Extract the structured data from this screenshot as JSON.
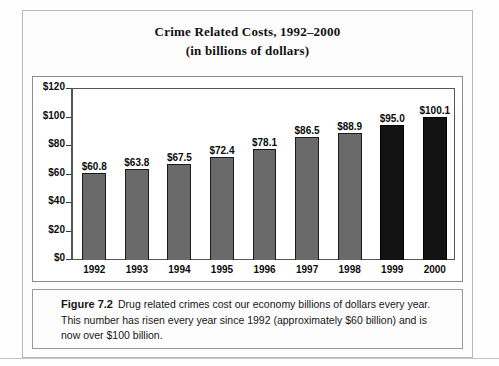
{
  "chart_title": "Crime Related Costs, 1992–2000",
  "chart_subtitle": "(in billions of dollars)",
  "caption": {
    "figure_number": "Figure 7.2",
    "body": "Drug related crimes cost our economy billions of dollars every year. This number has risen every year since 1992 (approximately $60 billion) and is now over $100 billion."
  },
  "colors": {
    "bar_gray": "#6a6a6a",
    "bar_black": "#121212",
    "frame": "#8d8d8d",
    "text": "#111111"
  },
  "chart_data": {
    "type": "bar",
    "title": "Crime Related Costs, 1992–2000",
    "subtitle": "(in billions of dollars)",
    "xlabel": "",
    "ylabel": "",
    "ylim": [
      0,
      120
    ],
    "ytick_values": [
      120,
      100,
      80,
      60,
      40,
      20,
      0
    ],
    "ytick_labels": [
      "$120",
      "$100",
      "$80",
      "$60",
      "$40",
      "$20",
      "$0"
    ],
    "grid": false,
    "legend": false,
    "categories": [
      "1992",
      "1993",
      "1994",
      "1995",
      "1996",
      "1997",
      "1998",
      "1999",
      "2000"
    ],
    "values": [
      60.8,
      63.8,
      67.5,
      72.4,
      78.1,
      86.5,
      88.9,
      95.0,
      100.1
    ],
    "data_labels": [
      "$60.8",
      "$63.8",
      "$67.5",
      "$72.4",
      "$78.1",
      "$86.5",
      "$88.9",
      "$95.0",
      "$100.1"
    ],
    "bar_colors": [
      "gray",
      "gray",
      "gray",
      "gray",
      "gray",
      "gray",
      "gray",
      "black",
      "black"
    ]
  }
}
